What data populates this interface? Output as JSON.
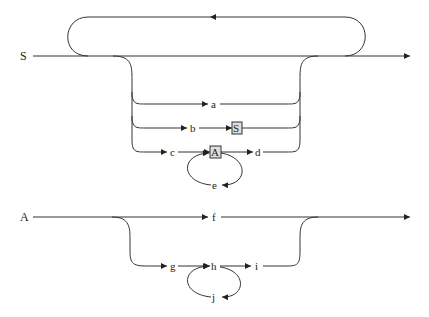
{
  "diagram": {
    "type": "syntax-diagram",
    "colors": {
      "line": "#333333",
      "box_fill": "#dddddd",
      "background": "#ffffff"
    },
    "rules": [
      {
        "name": "S",
        "loop": "repeat-back",
        "alternatives": [
          {
            "items": [
              {
                "kind": "terminal",
                "text": "a"
              }
            ]
          },
          {
            "items": [
              {
                "kind": "terminal",
                "text": "b"
              },
              {
                "kind": "nonterminal",
                "text": "S"
              }
            ]
          },
          {
            "items": [
              {
                "kind": "terminal",
                "text": "c"
              },
              {
                "kind": "nonterminal",
                "text": "A",
                "self_loop": "e"
              },
              {
                "kind": "terminal",
                "text": "d"
              }
            ]
          }
        ]
      },
      {
        "name": "A",
        "alternatives": [
          {
            "items": [
              {
                "kind": "terminal",
                "text": "f"
              }
            ]
          },
          {
            "items": [
              {
                "kind": "terminal",
                "text": "g"
              },
              {
                "kind": "terminal",
                "text": "h",
                "self_loop": "j"
              },
              {
                "kind": "terminal",
                "text": "i"
              }
            ]
          }
        ]
      }
    ],
    "labels": {
      "S_rule": "S",
      "a": "a",
      "b": "b",
      "S_box": "S",
      "c": "c",
      "A_box": "A",
      "d": "d",
      "e": "e",
      "A_rule": "A",
      "f": "f",
      "g": "g",
      "h": "h",
      "i": "i",
      "j": "j"
    }
  }
}
